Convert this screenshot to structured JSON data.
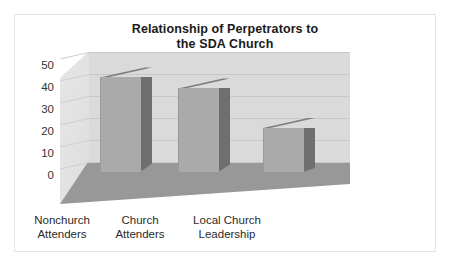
{
  "frame": {
    "border_color": "#e4e4e4"
  },
  "chart_data": {
    "type": "bar",
    "title": "Relationship of Perpetrators to the SDA Church",
    "title_line1": "Relationship of Perpetrators to",
    "title_line2": "the SDA Church",
    "categories": [
      "Nonchurch Attenders",
      "Church Attenders",
      "Local Church Leadership"
    ],
    "category_lines": [
      [
        "Nonchurch",
        "Attenders"
      ],
      [
        "Church",
        "Attenders"
      ],
      [
        "Local Church",
        "Leadership"
      ]
    ],
    "values": [
      43,
      38,
      20
    ],
    "xlabel": "",
    "ylabel": "",
    "ylim": [
      0,
      50
    ],
    "yticks": [
      0,
      10,
      20,
      30,
      40,
      50
    ],
    "ytick_labels": [
      "0",
      "10",
      "20",
      "30",
      "40",
      "50"
    ],
    "grid": true,
    "legend": false,
    "style": "3d-column",
    "colors": {
      "bar_front": "#aaaaaa",
      "bar_side": "#6f6f6f",
      "bar_top": "#7d7d7d",
      "back_wall": "#dadada",
      "floor": "#989898",
      "gridline": "#c8c8c8",
      "title_text": "#1a1a1a",
      "tick_text": "#333333"
    }
  }
}
